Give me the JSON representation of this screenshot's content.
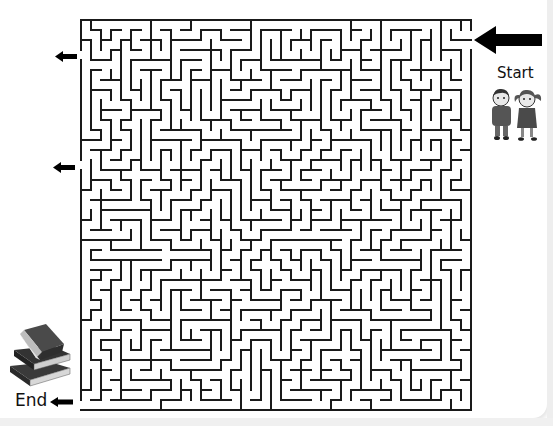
{
  "puzzle": {
    "type": "maze",
    "grid": {
      "cols": 39,
      "rows": 39,
      "cell_px": 10,
      "wall_px": 2
    },
    "colors": {
      "wall": "#1a1a1a",
      "background": "#ffffff",
      "arrow": "#000000"
    },
    "start": {
      "label": "Start",
      "side": "right",
      "row": 1
    },
    "end": {
      "label": "End",
      "side": "left",
      "row": 38
    },
    "decoy_exits": [
      {
        "side": "left",
        "row": 3
      },
      {
        "side": "left",
        "row": 14
      }
    ]
  },
  "labels": {
    "start": "Start",
    "end": "End"
  },
  "arrows": {
    "start_arrow": "arrow-left-large",
    "end_arrow": "arrow-left-small",
    "decoy_arrow_1": "arrow-left-small",
    "decoy_arrow_2": "arrow-left-small"
  },
  "illustrations": {
    "start": "two-children-icon",
    "end": "stack-of-books-icon"
  }
}
